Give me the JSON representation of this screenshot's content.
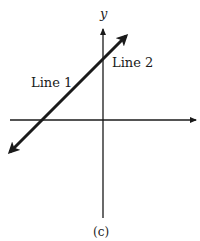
{
  "figure": {
    "caption": "(c)",
    "axis_label_y": "y",
    "line1_label": "Line 1",
    "line2_label": "Line 2",
    "colors": {
      "ink": "#1a1a1a",
      "background": "#ffffff"
    }
  },
  "diagram": {
    "axes": {
      "x_axis_arrow": "right",
      "y_axis_arrow": "up"
    },
    "lines": [
      {
        "name": "Line 1",
        "slope": "positive",
        "coincident_with": "Line 2"
      },
      {
        "name": "Line 2",
        "slope": "positive",
        "coincident_with": "Line 1"
      }
    ]
  }
}
